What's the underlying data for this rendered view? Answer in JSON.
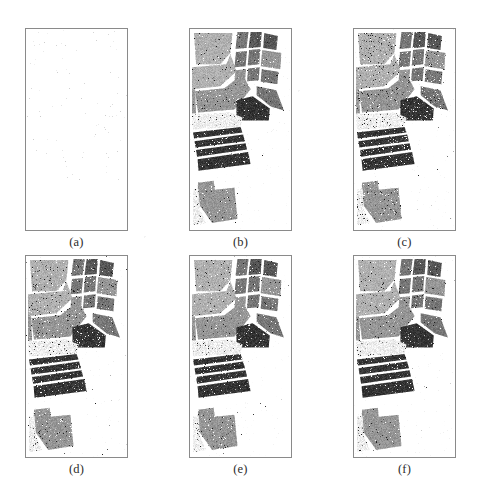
{
  "figure": {
    "type": "image-grid",
    "kind": "hyperspectral-classification-maps",
    "background_color": "#ffffff",
    "frame_color": "#8a8a8a",
    "rows": 2,
    "columns": 3,
    "panel_width": 103,
    "panel_height": 203,
    "caption_font_size": 12.5,
    "panels": [
      {
        "id": "panel-a",
        "caption": "(a)",
        "x": 25,
        "y": 28,
        "content": "blank",
        "description": "empty white map with faint speckle noise",
        "speckle_density": 0.004,
        "speckle_color": "#b9b9b9"
      },
      {
        "id": "panel-b",
        "caption": "(b)",
        "x": 189,
        "y": 28,
        "content": "classification-map",
        "description": "grayscale land-cover classification map",
        "noise_level": 0.05
      },
      {
        "id": "panel-c",
        "caption": "(c)",
        "x": 353,
        "y": 28,
        "content": "classification-map",
        "description": "grayscale land-cover classification map",
        "noise_level": 0.1
      },
      {
        "id": "panel-d",
        "caption": "(d)",
        "x": 25,
        "y": 255,
        "content": "classification-map",
        "description": "grayscale land-cover classification map",
        "noise_level": 0.09
      },
      {
        "id": "panel-e",
        "caption": "(e)",
        "x": 189,
        "y": 255,
        "content": "classification-map",
        "description": "grayscale land-cover classification map",
        "noise_level": 0.07
      },
      {
        "id": "panel-f",
        "caption": "(f)",
        "x": 353,
        "y": 255,
        "content": "classification-map",
        "description": "grayscale land-cover classification map",
        "noise_level": 0.06
      }
    ],
    "class_gray_levels": {
      "background": 255,
      "very_light": 238,
      "light": 205,
      "mid_light": 176,
      "mid": 150,
      "mid_dark": 118,
      "dark": 86,
      "very_dark": 52,
      "near_black": 30
    },
    "regions": [
      {
        "name": "upper-left-field-light",
        "gray": 176,
        "points": [
          [
            0.04,
            0.02
          ],
          [
            0.42,
            0.02
          ],
          [
            0.4,
            0.12
          ],
          [
            0.3,
            0.175
          ],
          [
            0.06,
            0.175
          ]
        ]
      },
      {
        "name": "upper-left-field-light-lower",
        "gray": 176,
        "points": [
          [
            0.02,
            0.19
          ],
          [
            0.36,
            0.175
          ],
          [
            0.4,
            0.125
          ],
          [
            0.46,
            0.21
          ],
          [
            0.3,
            0.285
          ],
          [
            0.02,
            0.3
          ]
        ]
      },
      {
        "name": "mid-left-field-midlight",
        "gray": 150,
        "points": [
          [
            0.05,
            0.31
          ],
          [
            0.34,
            0.295
          ],
          [
            0.52,
            0.225
          ],
          [
            0.6,
            0.3
          ],
          [
            0.44,
            0.4
          ],
          [
            0.08,
            0.415
          ]
        ]
      },
      {
        "name": "left-lower-field-light",
        "gray": 150,
        "points": [
          [
            0.02,
            0.3
          ],
          [
            0.05,
            0.3
          ],
          [
            0.06,
            0.42
          ],
          [
            0.02,
            0.42
          ]
        ]
      },
      {
        "name": "strip-top-a",
        "gray": 118,
        "points": [
          [
            0.47,
            0.015
          ],
          [
            0.58,
            0.015
          ],
          [
            0.56,
            0.095
          ],
          [
            0.45,
            0.1
          ]
        ]
      },
      {
        "name": "strip-top-b",
        "gray": 86,
        "points": [
          [
            0.6,
            0.015
          ],
          [
            0.71,
            0.015
          ],
          [
            0.7,
            0.09
          ],
          [
            0.58,
            0.095
          ]
        ]
      },
      {
        "name": "strip-top-c",
        "gray": 86,
        "points": [
          [
            0.735,
            0.02
          ],
          [
            0.87,
            0.035
          ],
          [
            0.855,
            0.105
          ],
          [
            0.725,
            0.095
          ]
        ]
      },
      {
        "name": "strip-mid-a",
        "gray": 118,
        "points": [
          [
            0.455,
            0.115
          ],
          [
            0.565,
            0.11
          ],
          [
            0.55,
            0.185
          ],
          [
            0.44,
            0.19
          ]
        ]
      },
      {
        "name": "strip-mid-b",
        "gray": 118,
        "points": [
          [
            0.585,
            0.105
          ],
          [
            0.695,
            0.1
          ],
          [
            0.685,
            0.175
          ],
          [
            0.572,
            0.182
          ]
        ]
      },
      {
        "name": "strip-mid-c",
        "gray": 150,
        "points": [
          [
            0.715,
            0.105
          ],
          [
            0.905,
            0.12
          ],
          [
            0.895,
            0.2
          ],
          [
            0.7,
            0.185
          ]
        ]
      },
      {
        "name": "strip-low-a",
        "gray": 150,
        "points": [
          [
            0.45,
            0.205
          ],
          [
            0.555,
            0.2
          ],
          [
            0.545,
            0.26
          ],
          [
            0.44,
            0.265
          ]
        ]
      },
      {
        "name": "strip-low-b",
        "gray": 118,
        "points": [
          [
            0.575,
            0.197
          ],
          [
            0.69,
            0.19
          ],
          [
            0.68,
            0.255
          ],
          [
            0.565,
            0.26
          ]
        ]
      },
      {
        "name": "strip-low-c",
        "gray": 118,
        "points": [
          [
            0.71,
            0.2
          ],
          [
            0.875,
            0.213
          ],
          [
            0.865,
            0.275
          ],
          [
            0.7,
            0.262
          ]
        ]
      },
      {
        "name": "right-field-mid",
        "gray": 118,
        "points": [
          [
            0.66,
            0.285
          ],
          [
            0.855,
            0.305
          ],
          [
            0.93,
            0.405
          ],
          [
            0.8,
            0.385
          ],
          [
            0.66,
            0.33
          ]
        ]
      },
      {
        "name": "center-dark-block",
        "gray": 52,
        "points": [
          [
            0.46,
            0.355
          ],
          [
            0.62,
            0.335
          ],
          [
            0.79,
            0.395
          ],
          [
            0.78,
            0.455
          ],
          [
            0.46,
            0.455
          ]
        ]
      },
      {
        "name": "center-light-band",
        "gray": 238,
        "points": [
          [
            0.02,
            0.425
          ],
          [
            0.4,
            0.415
          ],
          [
            0.52,
            0.44
          ],
          [
            0.5,
            0.485
          ],
          [
            0.03,
            0.5
          ]
        ]
      },
      {
        "name": "stripe-1",
        "gray": 52,
        "points": [
          [
            0.03,
            0.515
          ],
          [
            0.5,
            0.488
          ],
          [
            0.52,
            0.515
          ],
          [
            0.04,
            0.545
          ]
        ]
      },
      {
        "name": "stripe-2",
        "gray": 52,
        "points": [
          [
            0.045,
            0.558
          ],
          [
            0.525,
            0.525
          ],
          [
            0.545,
            0.558
          ],
          [
            0.055,
            0.59
          ]
        ]
      },
      {
        "name": "stripe-3",
        "gray": 52,
        "points": [
          [
            0.06,
            0.602
          ],
          [
            0.55,
            0.568
          ],
          [
            0.565,
            0.6
          ],
          [
            0.07,
            0.635
          ]
        ]
      },
      {
        "name": "stripe-4",
        "gray": 52,
        "points": [
          [
            0.075,
            0.648
          ],
          [
            0.575,
            0.612
          ],
          [
            0.6,
            0.672
          ],
          [
            0.085,
            0.705
          ]
        ]
      },
      {
        "name": "bottom-field-mid",
        "gray": 150,
        "points": [
          [
            0.08,
            0.765
          ],
          [
            0.235,
            0.755
          ],
          [
            0.245,
            0.8
          ],
          [
            0.44,
            0.79
          ],
          [
            0.47,
            0.945
          ],
          [
            0.22,
            0.965
          ],
          [
            0.07,
            0.86
          ]
        ]
      },
      {
        "name": "bottom-left-light",
        "gray": 238,
        "points": [
          [
            0.03,
            0.8
          ],
          [
            0.085,
            0.795
          ],
          [
            0.1,
            0.9
          ],
          [
            0.16,
            0.965
          ],
          [
            0.03,
            0.975
          ]
        ]
      }
    ]
  }
}
